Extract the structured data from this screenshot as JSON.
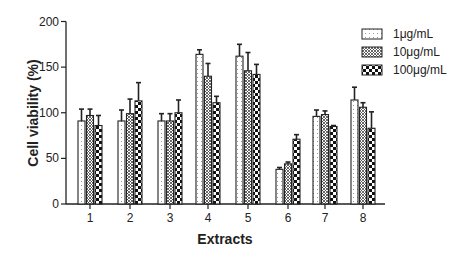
{
  "chart_data": {
    "type": "bar",
    "title": "",
    "xlabel": "Extracts",
    "ylabel": "Cell viability (%)",
    "ylim": [
      0,
      200
    ],
    "yticks": [
      0,
      50,
      100,
      150,
      200
    ],
    "grid": false,
    "legend_position": "top-right",
    "categories": [
      "1",
      "2",
      "3",
      "4",
      "5",
      "6",
      "7",
      "8"
    ],
    "series": [
      {
        "name": "1μg/mL",
        "pattern": "dotted",
        "values": [
          91,
          91,
          91,
          164,
          162,
          38,
          96,
          114
        ],
        "error_upper": [
          104,
          103,
          99,
          169,
          175,
          40,
          103,
          128
        ]
      },
      {
        "name": "10μg/mL",
        "pattern": "crosshatch",
        "values": [
          97,
          99,
          91,
          140,
          146,
          44,
          98,
          106
        ],
        "error_upper": [
          104,
          115,
          99,
          154,
          166,
          46,
          102,
          111
        ]
      },
      {
        "name": "100μg/mL",
        "pattern": "checker",
        "values": [
          86,
          113,
          100,
          111,
          142,
          71,
          85,
          83
        ],
        "error_upper": [
          97,
          133,
          114,
          118,
          153,
          76,
          86,
          101
        ]
      }
    ]
  }
}
